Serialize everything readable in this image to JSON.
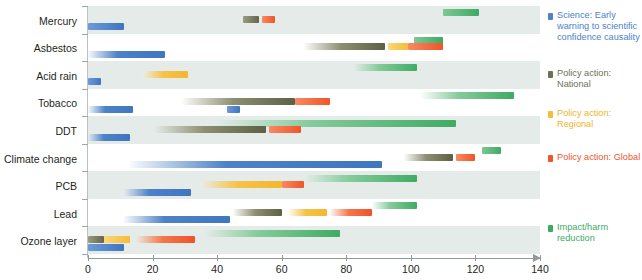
{
  "chart_data": {
    "type": "bar",
    "title": "",
    "subtitle": "",
    "xlabel": "",
    "ylabel": "",
    "xlim": [
      0,
      140
    ],
    "xticks": [
      0,
      20,
      40,
      60,
      80,
      100,
      120,
      140
    ],
    "grid": false,
    "orientation": "horizontal",
    "bar_style": "range/gantt spans with faded (uncertain) start edges",
    "legend_position": "right",
    "categories": [
      "Mercury",
      "Asbestos",
      "Acid rain",
      "Tobacco",
      "DDT",
      "Climate change",
      "PCB",
      "Lead",
      "Ozone layer"
    ],
    "series": [
      {
        "name": "Science: Early warning to scientific confidence causality",
        "key": "science",
        "color": "#4d82c8",
        "spans": [
          {
            "category": "Mercury",
            "start": 0,
            "end": 11
          },
          {
            "category": "Asbestos",
            "start": 0,
            "end": 24
          },
          {
            "category": "Acid rain",
            "start": 0,
            "end": 4
          },
          {
            "category": "Tobacco",
            "start": 0,
            "end": 14
          },
          {
            "category": "Tobacco",
            "start": 43,
            "end": 47
          },
          {
            "category": "DDT",
            "start": 0,
            "end": 13
          },
          {
            "category": "Climate change",
            "start": 13,
            "end": 91
          },
          {
            "category": "PCB",
            "start": 11,
            "end": 32
          },
          {
            "category": "Lead",
            "start": 11,
            "end": 44
          },
          {
            "category": "Ozone layer",
            "start": 0,
            "end": 11
          }
        ]
      },
      {
        "name": "Policy action: National",
        "key": "national",
        "color": "#6e7155",
        "spans": [
          {
            "category": "Mercury",
            "start": 48,
            "end": 53
          },
          {
            "category": "Asbestos",
            "start": 67,
            "end": 92
          },
          {
            "category": "Tobacco",
            "start": 29,
            "end": 64
          },
          {
            "category": "DDT",
            "start": 20,
            "end": 55
          },
          {
            "category": "Climate change",
            "start": 98,
            "end": 113
          },
          {
            "category": "Lead",
            "start": 45,
            "end": 60
          },
          {
            "category": "Ozone layer",
            "start": 0,
            "end": 5
          }
        ]
      },
      {
        "name": "Policy action: Regional",
        "key": "regional",
        "color": "#f5bd3c",
        "spans": [
          {
            "category": "Asbestos",
            "start": 93,
            "end": 99
          },
          {
            "category": "Acid rain",
            "start": 17,
            "end": 31
          },
          {
            "category": "PCB",
            "start": 35,
            "end": 60
          },
          {
            "category": "Lead",
            "start": 62,
            "end": 74
          },
          {
            "category": "Ozone layer",
            "start": 5,
            "end": 13
          }
        ]
      },
      {
        "name": "Policy action: Global",
        "key": "global",
        "color": "#f0552c",
        "spans": [
          {
            "category": "Mercury",
            "start": 54,
            "end": 58
          },
          {
            "category": "Asbestos",
            "start": 99,
            "end": 110
          },
          {
            "category": "Tobacco",
            "start": 64,
            "end": 75
          },
          {
            "category": "DDT",
            "start": 56,
            "end": 66
          },
          {
            "category": "Climate change",
            "start": 114,
            "end": 120
          },
          {
            "category": "PCB",
            "start": 60,
            "end": 67
          },
          {
            "category": "Lead",
            "start": 75,
            "end": 88
          },
          {
            "category": "Ozone layer",
            "start": 15,
            "end": 33
          }
        ]
      },
      {
        "name": "Impact/harm reduction",
        "key": "impact",
        "color": "#3cab62",
        "spans": [
          {
            "category": "Mercury",
            "start": 110,
            "end": 121
          },
          {
            "category": "Asbestos",
            "start": 101,
            "end": 110
          },
          {
            "category": "Acid rain",
            "start": 82,
            "end": 102
          },
          {
            "category": "Tobacco",
            "start": 103,
            "end": 132
          },
          {
            "category": "DDT",
            "start": 39,
            "end": 114
          },
          {
            "category": "Climate change",
            "start": 122,
            "end": 128
          },
          {
            "category": "PCB",
            "start": 67,
            "end": 102
          },
          {
            "category": "Lead",
            "start": 88,
            "end": 102
          },
          {
            "category": "Ozone layer",
            "start": 36,
            "end": 78
          }
        ]
      }
    ]
  },
  "axis": {
    "ticks": [
      "0",
      "20",
      "40",
      "60",
      "80",
      "100",
      "120",
      "140"
    ]
  },
  "categories": {
    "mercury": "Mercury",
    "asbestos": "Asbestos",
    "acid_rain": "Acid rain",
    "tobacco": "Tobacco",
    "ddt": "DDT",
    "climate_change": "Climate change",
    "pcb": "PCB",
    "lead": "Lead",
    "ozone_layer": "Ozone layer"
  },
  "legend": {
    "science": "Science: Early warning to scientific confidence causality",
    "national": "Policy action: National",
    "regional": "Policy action: Regional",
    "global": "Policy action: Global",
    "impact": "Impact/harm reduction"
  }
}
